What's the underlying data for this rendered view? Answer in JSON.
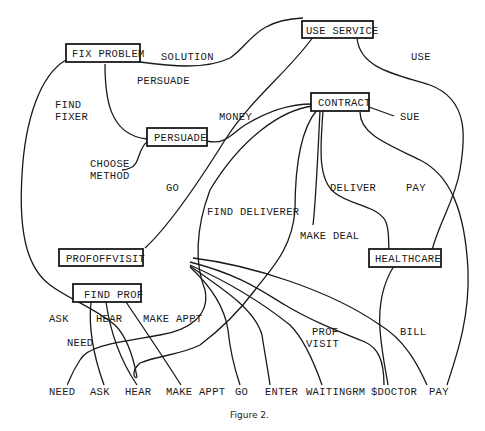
{
  "caption": "Figure 2.",
  "nodes": {
    "fix_problem": "FIX PROBLEM",
    "use_service": "USE SERVICE",
    "persuade": "PERSUADE",
    "contract": "CONTRACT",
    "profoffvisit": "PROFOFFVISIT",
    "healthcare": "HEALTHCARE",
    "find_prof": "FIND PROF"
  },
  "edge_labels": {
    "solution": "SOLUTION",
    "persuade": "PERSUADE",
    "use": "USE",
    "find_fixer_1": "FIND",
    "find_fixer_2": "FIXER",
    "money": "MONEY",
    "sue": "SUE",
    "choose_method_1": "CHOOSE",
    "choose_method_2": "METHOD",
    "go": "GO",
    "find_deliverer": "FIND DELIVERER",
    "deliver": "DELIVER",
    "pay": "PAY",
    "make_deal": "MAKE DEAL",
    "ask": "ASK",
    "hear": "HEAR",
    "make_appt": "MAKE APPT",
    "need": "NEED",
    "prof_visit_1": "PROF",
    "prof_visit_2": "VISIT",
    "bill": "BILL"
  },
  "leaves": [
    "NEED",
    "ASK",
    "HEAR",
    "MAKE APPT",
    "GO",
    "ENTER",
    "WAITINGRM",
    "$DOCTOR",
    "PAY"
  ]
}
